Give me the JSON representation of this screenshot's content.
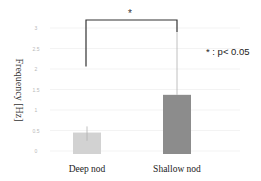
{
  "chart_data": {
    "type": "bar",
    "title": "",
    "xlabel": "",
    "ylabel": "Frequency [Hz]",
    "ylim": [
      0,
      3
    ],
    "yticks": [
      "0",
      "0.5",
      "1",
      "1.5",
      "2",
      "2.5",
      "3"
    ],
    "grid": true,
    "categories": [
      "Deep nod",
      "Shallow nod"
    ],
    "values": [
      0.45,
      1.37
    ],
    "error_low": [
      0.25,
      1.37
    ],
    "error_high": [
      0.6,
      2.9
    ],
    "bar_colors": [
      "#d2d2d2",
      "#8c8c8c"
    ],
    "annotations": {
      "significance_marker": "*",
      "significance_note": "* : p< 0.05"
    }
  }
}
